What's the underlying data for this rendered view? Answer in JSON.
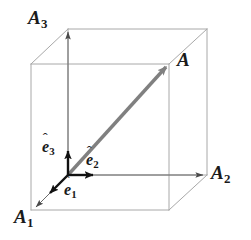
{
  "figure": {
    "type": "geometric-diagram",
    "width": 251,
    "height": 240,
    "background_color": "#ffffff"
  },
  "colors": {
    "cube_edge": "#a8a8a8",
    "axis_line": "#6b6b6b",
    "vector_main": "#808080",
    "unit_vector": "#111111",
    "label_text": "#1a1a1a"
  },
  "labels": {
    "axis_1": {
      "base": "A",
      "sub": "1"
    },
    "axis_2": {
      "base": "A",
      "sub": "2"
    },
    "axis_3": {
      "base": "A",
      "sub": "3"
    },
    "vector_a": {
      "base": "A",
      "sub": ""
    },
    "unit_1": {
      "base": "e",
      "sub": "1",
      "accent": "ˆ"
    },
    "unit_2": {
      "base": "e",
      "sub": "2",
      "accent": "ˆ"
    },
    "unit_3": {
      "base": "e",
      "sub": "3",
      "accent": "ˆ"
    }
  },
  "geometry": {
    "origin": {
      "x": 68,
      "y": 175
    },
    "cube": {
      "front_face": {
        "left": 31,
        "top": 64,
        "right": 169,
        "bottom": 210
      },
      "depth_offset": {
        "dx": 37,
        "dy": -35
      }
    },
    "vector_a": {
      "x1": 68,
      "y1": 175,
      "x2": 169,
      "y2": 64
    },
    "axis_a3": {
      "x1": 68,
      "y1": 175,
      "x2": 68,
      "y2": 30
    },
    "axis_a2": {
      "x1": 68,
      "y1": 175,
      "x2": 205,
      "y2": 175
    },
    "axis_a1": {
      "x1": 68,
      "y1": 175,
      "x2": 34,
      "y2": 209
    },
    "unit_e3": {
      "x1": 68,
      "y1": 175,
      "x2": 68,
      "y2": 147
    },
    "unit_e2": {
      "x1": 68,
      "y1": 175,
      "x2": 97,
      "y2": 175
    },
    "unit_e1": {
      "x1": 68,
      "y1": 175,
      "x2": 47,
      "y2": 196
    }
  },
  "label_positions": {
    "axis_3": {
      "left": 28,
      "top": 8
    },
    "vector_a": {
      "left": 177,
      "top": 50
    },
    "axis_2": {
      "left": 211,
      "top": 163
    },
    "axis_1": {
      "left": 14,
      "top": 207
    },
    "unit_3": {
      "left": 42,
      "top": 139
    },
    "unit_2": {
      "left": 86,
      "top": 152
    },
    "unit_1": {
      "left": 64,
      "top": 182
    }
  }
}
